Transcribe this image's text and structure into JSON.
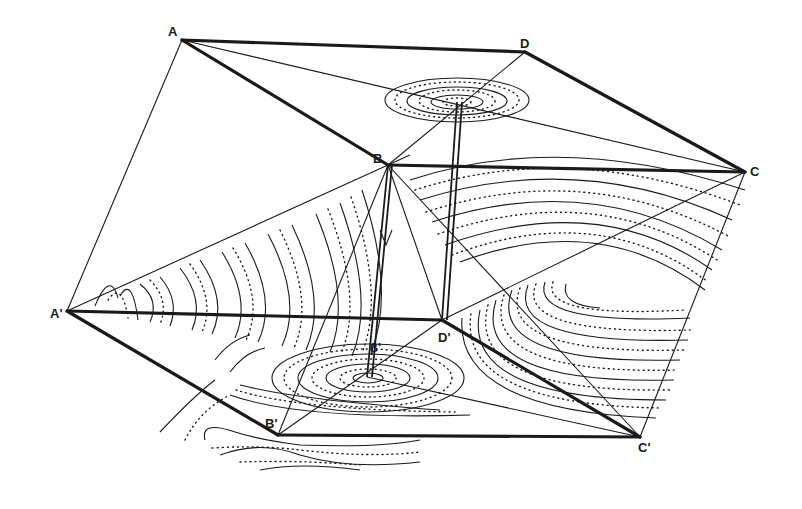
{
  "figure": {
    "type": "geometric-projection-diagram",
    "ink_color": "#1a1a1a",
    "background": "#ffffff"
  },
  "labels": {
    "A": "A",
    "B": "B",
    "C": "C",
    "D": "D",
    "A_prime": "A'",
    "B_prime": "B'",
    "C_prime": "C'",
    "D_prime": "D'",
    "beta_prime": "β'"
  },
  "vertices": {
    "A": [
      182,
      40
    ],
    "B": [
      388,
      165
    ],
    "C": [
      745,
      172
    ],
    "D": [
      525,
      52
    ],
    "A_prime": [
      67,
      311
    ],
    "B_prime": [
      278,
      435
    ],
    "C_prime": [
      640,
      437
    ],
    "D_prime": [
      442,
      320
    ],
    "O_top": [
      457,
      102
    ],
    "O_bottom": [
      367,
      377
    ]
  }
}
